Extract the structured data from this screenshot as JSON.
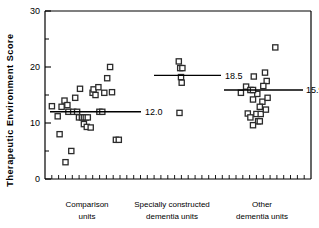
{
  "chart_data": {
    "type": "scatter",
    "title": "",
    "subtitle": "",
    "xlabel": "",
    "ylabel": "Therapeutic  Environment  Score",
    "ylim": [
      0,
      30
    ],
    "yticks": [
      0,
      10,
      20,
      30
    ],
    "ytick_labels": [
      "0",
      "10",
      "20",
      "30"
    ],
    "yminor_ticks": [
      5,
      15,
      25
    ],
    "grid": false,
    "legend": "none",
    "x_axis_minor_ticks": 38,
    "marker": "open-square",
    "categories": [
      "Comparison units",
      "Specially constructed dementia units",
      "Other dementia units"
    ],
    "series": [
      {
        "name": "Comparison units",
        "category_label_line1": "Comparison",
        "category_label_line2": "units",
        "mean": 12.0,
        "mean_label": "12.0",
        "n": 33,
        "points": [
          {
            "x": 0.04,
            "y": 13.0
          },
          {
            "x": 0.1,
            "y": 11.2
          },
          {
            "x": 0.14,
            "y": 12.9
          },
          {
            "x": 0.17,
            "y": 14.0
          },
          {
            "x": 0.2,
            "y": 13.2
          },
          {
            "x": 0.21,
            "y": 12.0
          },
          {
            "x": 0.26,
            "y": 12.0
          },
          {
            "x": 0.28,
            "y": 14.5
          },
          {
            "x": 0.3,
            "y": 12.0
          },
          {
            "x": 0.32,
            "y": 11.0
          },
          {
            "x": 0.33,
            "y": 16.1
          },
          {
            "x": 0.35,
            "y": 11.0
          },
          {
            "x": 0.37,
            "y": 11.0
          },
          {
            "x": 0.39,
            "y": 11.0
          },
          {
            "x": 0.41,
            "y": 11.0
          },
          {
            "x": 0.37,
            "y": 9.8
          },
          {
            "x": 0.4,
            "y": 9.3
          },
          {
            "x": 0.44,
            "y": 9.2
          },
          {
            "x": 0.46,
            "y": 15.4
          },
          {
            "x": 0.47,
            "y": 16.0
          },
          {
            "x": 0.49,
            "y": 15.0
          },
          {
            "x": 0.52,
            "y": 16.4
          },
          {
            "x": 0.53,
            "y": 12.0
          },
          {
            "x": 0.56,
            "y": 12.0
          },
          {
            "x": 0.58,
            "y": 15.4
          },
          {
            "x": 0.61,
            "y": 18.0
          },
          {
            "x": 0.64,
            "y": 20.0
          },
          {
            "x": 0.66,
            "y": 15.5
          },
          {
            "x": 0.7,
            "y": 7.0
          },
          {
            "x": 0.73,
            "y": 7.0
          },
          {
            "x": 0.12,
            "y": 8.0
          },
          {
            "x": 0.24,
            "y": 5.0
          },
          {
            "x": 0.18,
            "y": 3.0
          }
        ]
      },
      {
        "name": "Specially constructed dementia units",
        "category_label_line1": "Specially constructed",
        "category_label_line2": "dementia units",
        "mean": 18.5,
        "mean_label": "18.5",
        "n": 6,
        "points": [
          {
            "x": 0.4,
            "y": 21.0
          },
          {
            "x": 0.42,
            "y": 19.8
          },
          {
            "x": 0.45,
            "y": 19.8
          },
          {
            "x": 0.43,
            "y": 18.2
          },
          {
            "x": 0.44,
            "y": 17.2
          },
          {
            "x": 0.41,
            "y": 11.8
          }
        ]
      },
      {
        "name": "Other dementia units",
        "category_label_line1": "Other",
        "category_label_line2": "dementia units",
        "mean": 15.9,
        "mean_label": "15.9",
        "n": 22,
        "points": [
          {
            "x": 0.62,
            "y": 23.5
          },
          {
            "x": 0.5,
            "y": 19.0
          },
          {
            "x": 0.37,
            "y": 18.3
          },
          {
            "x": 0.52,
            "y": 17.5
          },
          {
            "x": 0.28,
            "y": 16.5
          },
          {
            "x": 0.48,
            "y": 16.6
          },
          {
            "x": 0.22,
            "y": 15.4
          },
          {
            "x": 0.41,
            "y": 15.2
          },
          {
            "x": 0.36,
            "y": 14.2
          },
          {
            "x": 0.47,
            "y": 13.8
          },
          {
            "x": 0.33,
            "y": 15.9
          },
          {
            "x": 0.36,
            "y": 15.9
          },
          {
            "x": 0.53,
            "y": 14.5
          },
          {
            "x": 0.44,
            "y": 12.9
          },
          {
            "x": 0.3,
            "y": 11.7
          },
          {
            "x": 0.4,
            "y": 11.6
          },
          {
            "x": 0.45,
            "y": 11.6
          },
          {
            "x": 0.51,
            "y": 12.4
          },
          {
            "x": 0.33,
            "y": 11.0
          },
          {
            "x": 0.42,
            "y": 10.3
          },
          {
            "x": 0.44,
            "y": 10.3
          },
          {
            "x": 0.36,
            "y": 9.6
          }
        ]
      }
    ]
  }
}
